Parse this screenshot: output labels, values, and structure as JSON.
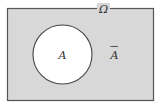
{
  "diagram": {
    "type": "venn",
    "universal_set": {
      "label": "Ω",
      "fill": "#d8d8d8",
      "stroke": "#555555"
    },
    "set_a": {
      "label": "A",
      "fill": "#ffffff",
      "stroke": "#444444"
    },
    "complement": {
      "label": "A",
      "overline": true
    }
  }
}
